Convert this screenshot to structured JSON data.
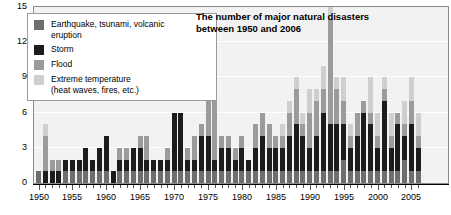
{
  "chart_data": {
    "type": "bar",
    "title": "The number of major natural disasters between 1950 and 2006",
    "stacked": true,
    "xlabel": "",
    "ylabel": "",
    "ylim": [
      0,
      15
    ],
    "yticks": [
      0,
      3,
      6,
      9,
      12,
      15
    ],
    "grid": true,
    "legend_position": "top-left",
    "xtick_labels": [
      "1950",
      "1955",
      "1960",
      "1965",
      "1970",
      "1975",
      "1980",
      "1985",
      "1990",
      "1995",
      "2000",
      "2005"
    ],
    "xtick_years": [
      1950,
      1955,
      1960,
      1965,
      1970,
      1975,
      1980,
      1985,
      1990,
      1995,
      2000,
      2005
    ],
    "categories": [
      1950,
      1951,
      1952,
      1953,
      1954,
      1955,
      1956,
      1957,
      1958,
      1959,
      1960,
      1961,
      1962,
      1963,
      1964,
      1965,
      1966,
      1967,
      1968,
      1969,
      1970,
      1971,
      1972,
      1973,
      1974,
      1975,
      1976,
      1977,
      1978,
      1979,
      1980,
      1981,
      1982,
      1983,
      1984,
      1985,
      1986,
      1987,
      1988,
      1989,
      1990,
      1991,
      1992,
      1993,
      1994,
      1995,
      1996,
      1997,
      1998,
      1999,
      2000,
      2001,
      2002,
      2003,
      2004,
      2005,
      2006
    ],
    "series": [
      {
        "name": "Earthquake, tsunami, volcanic eruption",
        "color": "#6e6e6e",
        "values": [
          1,
          0,
          0,
          0,
          1,
          1,
          1,
          1,
          1,
          1,
          1,
          0,
          1,
          1,
          1,
          1,
          1,
          1,
          1,
          1,
          1,
          1,
          1,
          1,
          1,
          1,
          1,
          1,
          1,
          1,
          1,
          1,
          1,
          1,
          1,
          1,
          1,
          1,
          1,
          1,
          1,
          1,
          1,
          1,
          1,
          2,
          1,
          1,
          1,
          1,
          1,
          1,
          1,
          1,
          2,
          1,
          1
        ]
      },
      {
        "name": "Storm",
        "color": "#1c1c1c",
        "values": [
          0,
          1,
          1,
          1,
          1,
          1,
          1,
          2,
          1,
          2,
          3,
          1,
          1,
          1,
          2,
          2,
          1,
          1,
          1,
          1,
          5,
          5,
          1,
          1,
          3,
          3,
          1,
          2,
          2,
          1,
          2,
          1,
          2,
          3,
          2,
          2,
          2,
          3,
          4,
          3,
          2,
          3,
          5,
          4,
          4,
          3,
          2,
          3,
          5,
          4,
          2,
          6,
          2,
          4,
          2,
          4,
          2
        ]
      },
      {
        "name": "Flood",
        "color": "#9b9b9b",
        "values": [
          0,
          3,
          1,
          1,
          0,
          0,
          0,
          0,
          0,
          0,
          0,
          0,
          1,
          1,
          0,
          1,
          2,
          0,
          0,
          1,
          0,
          0,
          1,
          2,
          1,
          3,
          8,
          1,
          1,
          1,
          1,
          0,
          2,
          2,
          2,
          1,
          1,
          2,
          3,
          1,
          3,
          3,
          2,
          9,
          3,
          2,
          1,
          2,
          1,
          1,
          1,
          1,
          1,
          1,
          1,
          2,
          1
        ]
      },
      {
        "name": "Extreme temperature (heat waves, fires, etc.)",
        "color": "#cfcfcf",
        "values": [
          0,
          1,
          0,
          0,
          0,
          0,
          0,
          0,
          0,
          0,
          0,
          0,
          0,
          0,
          0,
          0,
          0,
          0,
          0,
          0,
          0,
          0,
          0,
          0,
          0,
          0,
          0,
          0,
          0,
          0,
          0,
          0,
          0,
          0,
          0,
          0,
          1,
          1,
          1,
          1,
          2,
          1,
          2,
          1,
          1,
          2,
          1,
          0,
          0,
          3,
          2,
          1,
          2,
          0,
          2,
          2,
          2
        ]
      }
    ],
    "totals": [
      1,
      5,
      2,
      2,
      2,
      2,
      2,
      3,
      2,
      3,
      4,
      1,
      3,
      3,
      3,
      4,
      4,
      2,
      2,
      3,
      6,
      6,
      3,
      4,
      5,
      7,
      10,
      4,
      4,
      3,
      4,
      2,
      5,
      6,
      5,
      4,
      5,
      7,
      9,
      6,
      8,
      8,
      10,
      15,
      9,
      9,
      5,
      6,
      7,
      9,
      6,
      9,
      6,
      5,
      7,
      9,
      6
    ]
  },
  "legend": {
    "items": [
      {
        "label": "Earthquake, tsunami, volcanic eruption",
        "swatch": "eq"
      },
      {
        "label": "Storm",
        "swatch": "storm"
      },
      {
        "label": "Flood",
        "swatch": "flood"
      },
      {
        "label": "Extreme temperature (heat waves, fires, etc.)",
        "swatch": "temp"
      }
    ],
    "line1_eq": "Earthquake, tsunami, volcanic",
    "line2_eq": "eruption",
    "storm": "Storm",
    "flood": "Flood",
    "line1_temp": "Extreme temperature",
    "line2_temp": "(heat waves, fires, etc.)"
  },
  "colors": {
    "earthquake": "#6e6e6e",
    "storm": "#1c1c1c",
    "flood": "#9b9b9b",
    "extreme_temperature": "#cfcfcf",
    "plot_background": "#f2f2f2",
    "gridline": "#ffffff"
  }
}
